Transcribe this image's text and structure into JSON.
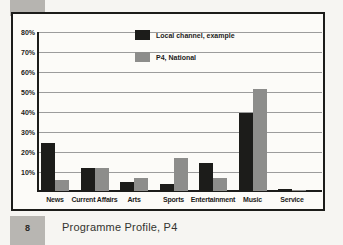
{
  "figure": {
    "number": "8",
    "caption": "Programme Profile, P4"
  },
  "chart_data": {
    "type": "bar",
    "title": "",
    "xlabel": "",
    "ylabel": "",
    "categories": [
      "News",
      "Current Affairs",
      "Arts",
      "Sports",
      "Entertainment",
      "Music",
      "Service"
    ],
    "series": [
      {
        "name": "Local channel, example",
        "color": "#1c1c1a",
        "values": [
          24,
          11.5,
          4.5,
          3.5,
          14,
          39,
          1
        ]
      },
      {
        "name": "P4, National",
        "color": "#8d8d8b",
        "values": [
          5.5,
          11.5,
          6.5,
          16.5,
          6.5,
          51,
          0.5
        ]
      }
    ],
    "ylim": [
      0,
      80
    ],
    "yticks": [
      {
        "value": 10,
        "label": "10%"
      },
      {
        "value": 20,
        "label": "20%"
      },
      {
        "value": 30,
        "label": "30%"
      },
      {
        "value": 40,
        "label": "40%"
      },
      {
        "value": 50,
        "label": "50%"
      },
      {
        "value": 60,
        "label": "60%"
      },
      {
        "value": 70,
        "label": "70%"
      },
      {
        "value": 80,
        "label": "80%"
      }
    ],
    "grid": true,
    "legend_position": "top-center-inside"
  },
  "colors": {
    "bar_local": "#1c1c1a",
    "bar_national": "#8d8d8b",
    "gridline": "#9c9c9c",
    "axis": "#1c1c1a",
    "panel_background": "#fcfbf8",
    "page_background": "#f6f5f2",
    "decor_square": "#b6b4b0"
  }
}
